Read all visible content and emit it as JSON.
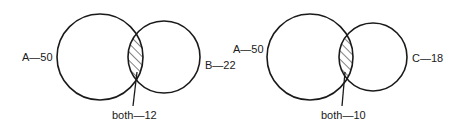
{
  "diagrams": [
    {
      "set1": {
        "label": "A—50",
        "name": "A",
        "count": 50
      },
      "set2": {
        "label": "B—22",
        "name": "B",
        "count": 22
      },
      "overlap": {
        "label": "both—12",
        "count": 12
      }
    },
    {
      "set1": {
        "label": "A—50",
        "name": "A",
        "count": 50
      },
      "set2": {
        "label": "C—18",
        "name": "C",
        "count": 18
      },
      "overlap": {
        "label": "both—10",
        "count": 10
      }
    }
  ]
}
